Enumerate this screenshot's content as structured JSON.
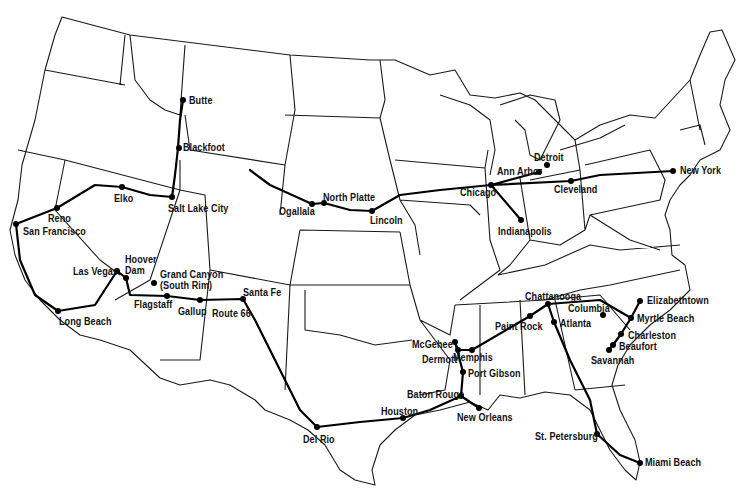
{
  "map": {
    "type": "United States road trip route map",
    "style": {
      "ink": "#000000",
      "background": "#ffffff"
    },
    "cities": [
      {
        "name": "Butte",
        "x": 183,
        "y": 100,
        "lx": 189,
        "ly": 95
      },
      {
        "name": "Blackfoot",
        "x": 179,
        "y": 148,
        "lx": 183,
        "ly": 142
      },
      {
        "name": "Salt Lake City",
        "x": 172,
        "y": 197,
        "lx": 168,
        "ly": 203
      },
      {
        "name": "Elko",
        "x": 122,
        "y": 187,
        "lx": 114,
        "ly": 193
      },
      {
        "name": "Reno",
        "x": 57,
        "y": 208,
        "lx": 48,
        "ly": 213
      },
      {
        "name": "San Francisco",
        "x": 16,
        "y": 224,
        "lx": 23,
        "ly": 226
      },
      {
        "name": "Las Vegas",
        "x": 117,
        "y": 271,
        "lx": 73,
        "ly": 266
      },
      {
        "name": "Hoover Dam",
        "x": 126,
        "y": 278,
        "lx": 125,
        "ly": 254
      },
      {
        "name": "Grand Canyon (South Rim)",
        "x": 154,
        "y": 283,
        "lx": 160,
        "ly": 269
      },
      {
        "name": "Flagstaff",
        "x": 167,
        "y": 296,
        "lx": 134,
        "ly": 299
      },
      {
        "name": "Gallup",
        "x": 200,
        "y": 300,
        "lx": 178,
        "ly": 306
      },
      {
        "name": "Santa Fe",
        "x": 243,
        "y": 299,
        "lx": 243,
        "ly": 287
      },
      {
        "name": "Route 66",
        "x": 0,
        "y": 0,
        "lx": 212,
        "ly": 308
      },
      {
        "name": "Long Beach",
        "x": 58,
        "y": 311,
        "lx": 59,
        "ly": 316
      },
      {
        "name": "Ogallala",
        "x": 312,
        "y": 204,
        "lx": 279,
        "ly": 206
      },
      {
        "name": "North Platte",
        "x": 324,
        "y": 203,
        "lx": 323,
        "ly": 192
      },
      {
        "name": "Lincoln",
        "x": 372,
        "y": 211,
        "lx": 370,
        "ly": 215
      },
      {
        "name": "Chicago",
        "x": 491,
        "y": 185,
        "lx": 460,
        "ly": 187
      },
      {
        "name": "Ann Arbor",
        "x": 539,
        "y": 172,
        "lx": 497,
        "ly": 166
      },
      {
        "name": "Detroit",
        "x": 547,
        "y": 165,
        "lx": 534,
        "ly": 152
      },
      {
        "name": "Cleveland",
        "x": 571,
        "y": 181,
        "lx": 554,
        "ly": 184
      },
      {
        "name": "New York",
        "x": 673,
        "y": 171,
        "lx": 680,
        "ly": 165
      },
      {
        "name": "Indianapolis",
        "x": 521,
        "y": 220,
        "lx": 498,
        "ly": 226
      },
      {
        "name": "Memphis",
        "x": 472,
        "y": 350,
        "lx": 453,
        "ly": 352
      },
      {
        "name": "McGehee",
        "x": 455,
        "y": 342,
        "lx": 412,
        "ly": 339
      },
      {
        "name": "Dermott",
        "x": 458,
        "y": 350,
        "lx": 422,
        "ly": 354
      },
      {
        "name": "Port Gibson",
        "x": 463,
        "y": 372,
        "lx": 468,
        "ly": 368
      },
      {
        "name": "Baton Rouge",
        "x": 461,
        "y": 396,
        "lx": 407,
        "ly": 389
      },
      {
        "name": "New Orleans",
        "x": 479,
        "y": 408,
        "lx": 457,
        "ly": 412
      },
      {
        "name": "Houston",
        "x": 403,
        "y": 418,
        "lx": 381,
        "ly": 406
      },
      {
        "name": "Del Rio",
        "x": 317,
        "y": 427,
        "lx": 303,
        "ly": 434
      },
      {
        "name": "Paint Rock",
        "x": 530,
        "y": 316,
        "lx": 495,
        "ly": 321
      },
      {
        "name": "Chattanooga",
        "x": 548,
        "y": 304,
        "lx": 525,
        "ly": 291
      },
      {
        "name": "Atlanta",
        "x": 554,
        "y": 322,
        "lx": 560,
        "ly": 318
      },
      {
        "name": "Columbia",
        "x": 603,
        "y": 315,
        "lx": 568,
        "ly": 303
      },
      {
        "name": "Elizabethtown",
        "x": 640,
        "y": 301,
        "lx": 647,
        "ly": 295
      },
      {
        "name": "Myrtle Beach",
        "x": 631,
        "y": 318,
        "lx": 637,
        "ly": 313
      },
      {
        "name": "Charleston",
        "x": 621,
        "y": 334,
        "lx": 628,
        "ly": 330
      },
      {
        "name": "Beaufort",
        "x": 613,
        "y": 345,
        "lx": 619,
        "ly": 341
      },
      {
        "name": "Savannah",
        "x": 609,
        "y": 350,
        "lx": 591,
        "ly": 355
      },
      {
        "name": "St. Petersburg",
        "x": 597,
        "y": 434,
        "lx": 535,
        "ly": 431
      },
      {
        "name": "Miami Beach",
        "x": 640,
        "y": 463,
        "lx": 645,
        "ly": 457
      }
    ]
  }
}
